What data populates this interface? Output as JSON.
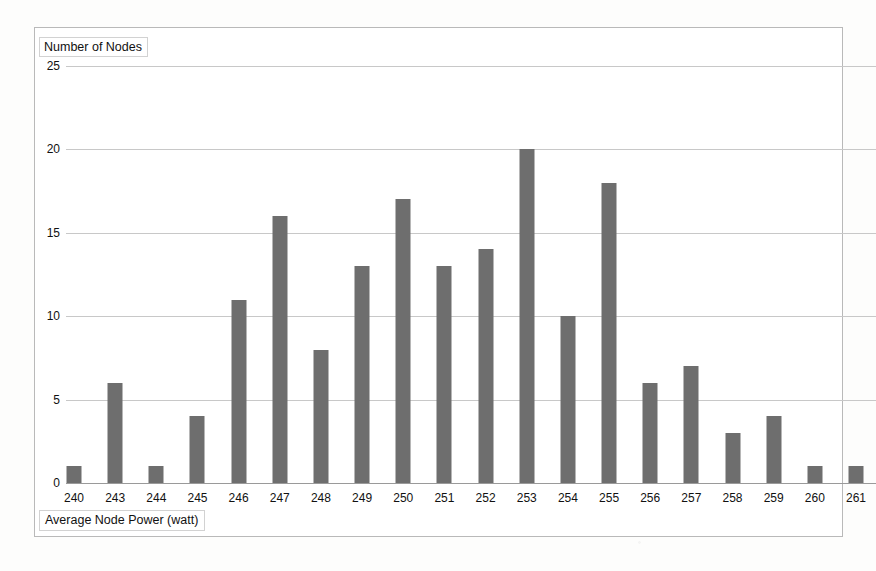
{
  "page": {
    "background_color": "#fdfdfc",
    "frame_border_color": "#b9b9b9"
  },
  "chart_data": {
    "type": "bar",
    "title": "",
    "subtitle": "",
    "xlabel": "Average Node Power (watt)",
    "ylabel": "Number of Nodes",
    "categories": [
      "240",
      "243",
      "244",
      "245",
      "246",
      "247",
      "248",
      "249",
      "250",
      "251",
      "252",
      "253",
      "254",
      "255",
      "256",
      "257",
      "258",
      "259",
      "260",
      "261"
    ],
    "values": [
      1,
      6,
      1,
      4,
      11,
      16,
      8,
      13,
      17,
      13,
      14,
      20,
      10,
      18,
      6,
      7,
      3,
      4,
      1,
      1
    ],
    "ylim": [
      0,
      25
    ],
    "ytick_labels": [
      "0",
      "5",
      "10",
      "15",
      "20",
      "25"
    ],
    "ytick_values": [
      0,
      5,
      10,
      15,
      20,
      25
    ],
    "grid": true,
    "grid_axis": "y",
    "legend": false,
    "legend_position": "none",
    "bar_color": "#6e6e6e",
    "grid_color": "#c8c8c8",
    "axis_color": "#9a9a9a"
  }
}
